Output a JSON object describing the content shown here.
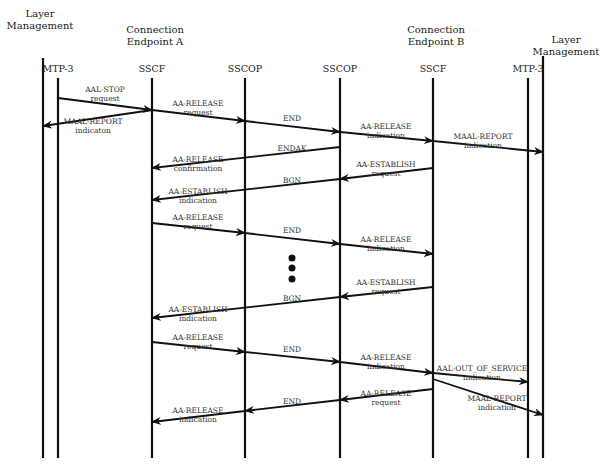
{
  "groups": [
    {
      "id": "lm_a",
      "label_line1": "Layer",
      "label_line2": "Management",
      "x": 40,
      "y": 8
    },
    {
      "id": "cep_a",
      "label_line1": "Connection",
      "label_line2": "Endpoint A",
      "x": 155,
      "y": 24
    },
    {
      "id": "cep_b",
      "label_line1": "Connection",
      "label_line2": "Endpoint B",
      "x": 436,
      "y": 24
    },
    {
      "id": "lm_b",
      "label_line1": "Layer",
      "label_line2": "Management",
      "x": 566,
      "y": 34
    }
  ],
  "lifelines": [
    {
      "id": "lm_a",
      "label": "",
      "x": 43,
      "y_top": 58,
      "y_bottom": 458
    },
    {
      "id": "mtp3_a",
      "label": "MTP-3",
      "x": 58,
      "y_top": 78,
      "y_bottom": 458
    },
    {
      "id": "sscf_a",
      "label": "SSCF",
      "x": 152,
      "y_top": 78,
      "y_bottom": 458
    },
    {
      "id": "sscop_a",
      "label": "SSCOP",
      "x": 245,
      "y_top": 78,
      "y_bottom": 458
    },
    {
      "id": "sscop_b",
      "label": "SSCOP",
      "x": 340,
      "y_top": 78,
      "y_bottom": 458
    },
    {
      "id": "sscf_b",
      "label": "SSCF",
      "x": 433,
      "y_top": 78,
      "y_bottom": 458
    },
    {
      "id": "mtp3_b",
      "label": "MTP-3",
      "x": 528,
      "y_top": 78,
      "y_bottom": 458
    },
    {
      "id": "lm_b",
      "label": "",
      "x": 543,
      "y_top": 56,
      "y_bottom": 458
    }
  ],
  "messages": [
    {
      "line1": "AAL-STOP",
      "line2": "request",
      "x1": 58,
      "y1": 98,
      "x2": 152,
      "y2": 110,
      "lx": 105,
      "ly": 85
    },
    {
      "line1": "MAAL-REPORT",
      "line2": "indicaton",
      "x1": 152,
      "y1": 110,
      "x2": 43,
      "y2": 126,
      "lx": 93,
      "ly": 117
    },
    {
      "line1": "AA-RELEASE",
      "line2": "request",
      "x1": 152,
      "y1": 110,
      "x2": 245,
      "y2": 121,
      "lx": 198,
      "ly": 99
    },
    {
      "line1": "END",
      "line2": "",
      "x1": 245,
      "y1": 121,
      "x2": 340,
      "y2": 132,
      "lx": 292,
      "ly": 114
    },
    {
      "line1": "AA-RELEASE",
      "line2": "indication",
      "x1": 340,
      "y1": 132,
      "x2": 433,
      "y2": 141,
      "lx": 386,
      "ly": 122
    },
    {
      "line1": "MAAL-REPORT",
      "line2": "indication",
      "x1": 433,
      "y1": 141,
      "x2": 543,
      "y2": 152,
      "lx": 483,
      "ly": 132
    },
    {
      "line1": "ENDAK",
      "line2": "",
      "x1": 340,
      "y1": 147,
      "x2": 152,
      "y2": 168,
      "lx": 292,
      "ly": 144
    },
    {
      "line1": "AA-RELEASE",
      "line2": "confirmation",
      "x1": 0,
      "y1": 0,
      "x2": 0,
      "y2": 0,
      "lx": 198,
      "ly": 155,
      "label_only": true
    },
    {
      "line1": "AA-ESTABLISH",
      "line2": "request",
      "x1": 433,
      "y1": 168,
      "x2": 340,
      "y2": 179,
      "lx": 386,
      "ly": 160
    },
    {
      "line1": "BGN",
      "line2": "",
      "x1": 340,
      "y1": 179,
      "x2": 152,
      "y2": 200,
      "lx": 292,
      "ly": 176
    },
    {
      "line1": "AA-ESTABLISH",
      "line2": "indication",
      "x1": 0,
      "y1": 0,
      "x2": 0,
      "y2": 0,
      "lx": 198,
      "ly": 187,
      "label_only": true
    },
    {
      "line1": "AA-RELEASE",
      "line2": "request",
      "x1": 152,
      "y1": 223,
      "x2": 245,
      "y2": 233,
      "lx": 198,
      "ly": 213
    },
    {
      "line1": "END",
      "line2": "",
      "x1": 245,
      "y1": 233,
      "x2": 340,
      "y2": 244,
      "lx": 292,
      "ly": 226
    },
    {
      "line1": "AA-RELEASE",
      "line2": "indication",
      "x1": 340,
      "y1": 244,
      "x2": 433,
      "y2": 254,
      "lx": 386,
      "ly": 235
    },
    {
      "line1": "AA-ESTABLISH",
      "line2": "request",
      "x1": 433,
      "y1": 287,
      "x2": 340,
      "y2": 297,
      "lx": 386,
      "ly": 278
    },
    {
      "line1": "BGN",
      "line2": "",
      "x1": 340,
      "y1": 297,
      "x2": 152,
      "y2": 318,
      "lx": 292,
      "ly": 294
    },
    {
      "line1": "AA-ESTABLISH",
      "line2": "indication",
      "x1": 0,
      "y1": 0,
      "x2": 0,
      "y2": 0,
      "lx": 198,
      "ly": 305,
      "label_only": true
    },
    {
      "line1": "AA-RELEASE",
      "line2": "request",
      "x1": 152,
      "y1": 342,
      "x2": 245,
      "y2": 352,
      "lx": 198,
      "ly": 333
    },
    {
      "line1": "END",
      "line2": "",
      "x1": 245,
      "y1": 352,
      "x2": 340,
      "y2": 362,
      "lx": 292,
      "ly": 345
    },
    {
      "line1": "AA-RELEASE",
      "line2": "indication",
      "x1": 340,
      "y1": 362,
      "x2": 433,
      "y2": 373,
      "lx": 386,
      "ly": 353
    },
    {
      "line1": "AAL-OUT_OF_SERVICE",
      "line2": "indication",
      "x1": 433,
      "y1": 373,
      "x2": 528,
      "y2": 382,
      "lx": 482,
      "ly": 364
    },
    {
      "line1": "AA-RELEASE",
      "line2": "request",
      "x1": 433,
      "y1": 389,
      "x2": 340,
      "y2": 400,
      "lx": 386,
      "ly": 389
    },
    {
      "line1": "MAAL-REPORT",
      "line2": "indication",
      "x1": 433,
      "y1": 379,
      "x2": 543,
      "y2": 415,
      "lx": 497,
      "ly": 394
    },
    {
      "line1": "END",
      "line2": "",
      "x1": 340,
      "y1": 400,
      "x2": 245,
      "y2": 411,
      "lx": 292,
      "ly": 397
    },
    {
      "line1": "AA-RELEASE",
      "line2": "indication",
      "x1": 245,
      "y1": 411,
      "x2": 152,
      "y2": 422,
      "lx": 198,
      "ly": 406
    }
  ],
  "ellipsis": {
    "x": 292,
    "dots_y": [
      258,
      268,
      279
    ],
    "r": 3.5
  },
  "colors": {
    "line": "#111111",
    "text": "#333333",
    "background": "#ffffff"
  }
}
